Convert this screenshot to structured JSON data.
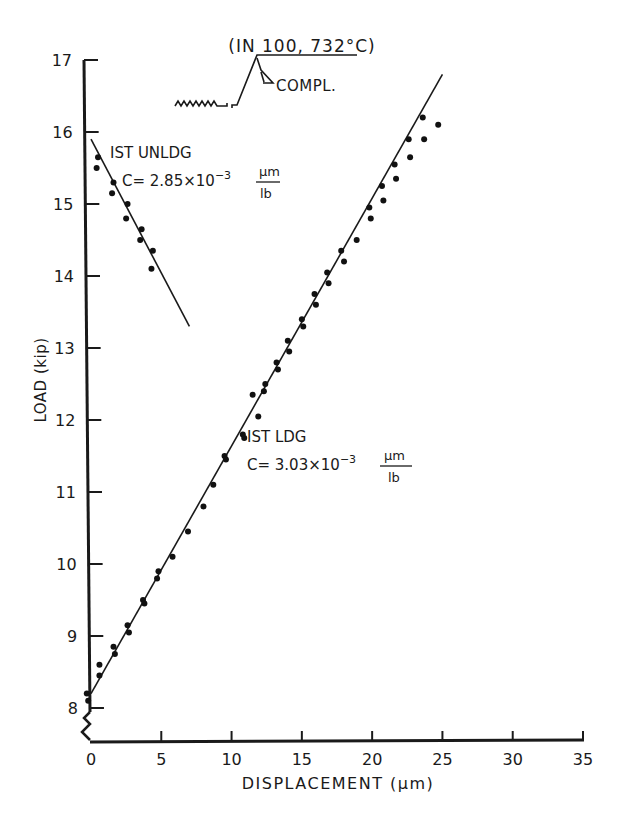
{
  "chart_data": {
    "type": "scatter",
    "title": "(IN 100, 732°C)",
    "inset_label": "COMPL.",
    "xlabel": "DISPLACEMENT (μm)",
    "ylabel": "LOAD (kip)",
    "xlim": [
      0,
      35
    ],
    "ylim": [
      8,
      17
    ],
    "x_ticks": [
      0,
      5,
      10,
      15,
      20,
      25,
      30,
      35
    ],
    "y_ticks": [
      8,
      9,
      10,
      11,
      12,
      13,
      14,
      15,
      16,
      17
    ],
    "grid": false,
    "axis_break": "y-axis broken below 8",
    "series": [
      {
        "name": "1ST UNLDG",
        "annotation_line1": "IST UNLDG",
        "annotation_line2": "C = 2.85×10⁻³ μm/lb",
        "compliance": "2.85×10^-3 μm/lb",
        "fit_line": {
          "x": [
            0,
            7.0
          ],
          "y": [
            15.9,
            13.3
          ]
        },
        "points": [
          {
            "x": 0.5,
            "y": 15.65
          },
          {
            "x": 0.4,
            "y": 15.5
          },
          {
            "x": 1.6,
            "y": 15.3
          },
          {
            "x": 1.5,
            "y": 15.15
          },
          {
            "x": 2.6,
            "y": 15.0
          },
          {
            "x": 2.5,
            "y": 14.8
          },
          {
            "x": 3.6,
            "y": 14.65
          },
          {
            "x": 3.5,
            "y": 14.5
          },
          {
            "x": 4.4,
            "y": 14.35
          },
          {
            "x": 4.3,
            "y": 14.1
          }
        ]
      },
      {
        "name": "1ST LDG",
        "annotation_line1": "IST LDG",
        "annotation_line2": "C = 3.03×10⁻³ μm/lb",
        "compliance": "3.03×10^-3 μm/lb",
        "fit_line": {
          "x": [
            0,
            25.0
          ],
          "y": [
            8.2,
            16.8
          ]
        },
        "points": [
          {
            "x": -0.3,
            "y": 8.2
          },
          {
            "x": -0.2,
            "y": 8.1
          },
          {
            "x": 0.6,
            "y": 8.6
          },
          {
            "x": 0.6,
            "y": 8.45
          },
          {
            "x": 1.6,
            "y": 8.85
          },
          {
            "x": 1.7,
            "y": 8.75
          },
          {
            "x": 2.6,
            "y": 9.15
          },
          {
            "x": 2.7,
            "y": 9.05
          },
          {
            "x": 3.7,
            "y": 9.5
          },
          {
            "x": 3.8,
            "y": 9.45
          },
          {
            "x": 4.8,
            "y": 9.9
          },
          {
            "x": 4.7,
            "y": 9.8
          },
          {
            "x": 5.8,
            "y": 10.1
          },
          {
            "x": 6.9,
            "y": 10.45
          },
          {
            "x": 8.0,
            "y": 10.8
          },
          {
            "x": 8.7,
            "y": 11.1
          },
          {
            "x": 9.5,
            "y": 11.5
          },
          {
            "x": 9.6,
            "y": 11.45
          },
          {
            "x": 10.8,
            "y": 11.8
          },
          {
            "x": 10.9,
            "y": 11.75
          },
          {
            "x": 11.5,
            "y": 12.35
          },
          {
            "x": 11.9,
            "y": 12.05
          },
          {
            "x": 12.4,
            "y": 12.5
          },
          {
            "x": 12.3,
            "y": 12.4
          },
          {
            "x": 13.2,
            "y": 12.8
          },
          {
            "x": 13.3,
            "y": 12.7
          },
          {
            "x": 14.0,
            "y": 13.1
          },
          {
            "x": 14.1,
            "y": 12.95
          },
          {
            "x": 15.0,
            "y": 13.4
          },
          {
            "x": 15.1,
            "y": 13.3
          },
          {
            "x": 15.9,
            "y": 13.75
          },
          {
            "x": 16.0,
            "y": 13.6
          },
          {
            "x": 16.8,
            "y": 14.05
          },
          {
            "x": 16.9,
            "y": 13.9
          },
          {
            "x": 17.8,
            "y": 14.35
          },
          {
            "x": 18.0,
            "y": 14.2
          },
          {
            "x": 18.9,
            "y": 14.5
          },
          {
            "x": 19.8,
            "y": 14.95
          },
          {
            "x": 19.9,
            "y": 14.8
          },
          {
            "x": 20.7,
            "y": 15.25
          },
          {
            "x": 20.8,
            "y": 15.05
          },
          {
            "x": 21.6,
            "y": 15.55
          },
          {
            "x": 21.7,
            "y": 15.35
          },
          {
            "x": 22.6,
            "y": 15.9
          },
          {
            "x": 22.7,
            "y": 15.65
          },
          {
            "x": 23.6,
            "y": 16.2
          },
          {
            "x": 23.7,
            "y": 15.9
          },
          {
            "x": 24.7,
            "y": 16.1
          }
        ]
      }
    ]
  }
}
